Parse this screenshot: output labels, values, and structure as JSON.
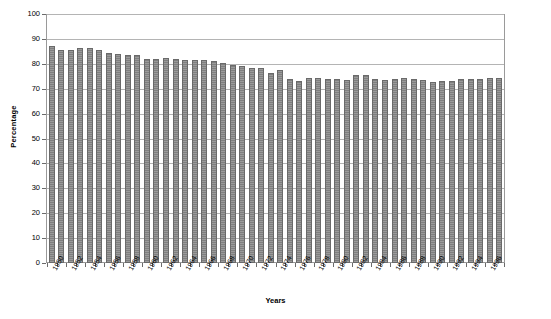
{
  "chart_data": {
    "type": "bar",
    "title": "",
    "xlabel": "Years",
    "ylabel": "Percentage",
    "ylim": [
      0,
      100
    ],
    "yticks": [
      0,
      10,
      20,
      30,
      40,
      50,
      60,
      70,
      80,
      90,
      100
    ],
    "grid": true,
    "legend": "none",
    "bar_color": "#7f7f7f",
    "categories": [
      "1950",
      "1951",
      "1952",
      "1953",
      "1954",
      "1955",
      "1956",
      "1957",
      "1958",
      "1959",
      "1960",
      "1961",
      "1962",
      "1963",
      "1964",
      "1965",
      "1966",
      "1967",
      "1968",
      "1969",
      "1970",
      "1971",
      "1972",
      "1973",
      "1974",
      "1975",
      "1976",
      "1977",
      "1978",
      "1979",
      "1980",
      "1981",
      "1982",
      "1983",
      "1984",
      "1985",
      "1986",
      "1987",
      "1988",
      "1989",
      "1990",
      "1991",
      "1992",
      "1993",
      "1994",
      "1995",
      "1996",
      "1997"
    ],
    "tick_labels": [
      "1950",
      "1952",
      "1954",
      "1956",
      "1958",
      "1960",
      "1962",
      "1964",
      "1966",
      "1968",
      "1970",
      "1972",
      "1974",
      "1976",
      "1978",
      "1980",
      "1982",
      "1984",
      "1986",
      "1988",
      "1990",
      "1992",
      "1994",
      "1996"
    ],
    "values": [
      87,
      85.5,
      85.5,
      86.5,
      86.5,
      85.5,
      84.5,
      84,
      83.5,
      83.5,
      82,
      82,
      82.5,
      82,
      81.5,
      81.5,
      81.5,
      81,
      80.5,
      79.5,
      79,
      78.5,
      78.5,
      76.5,
      77.5,
      74,
      73,
      74.5,
      74.5,
      74,
      74,
      73.5,
      75.5,
      75.5,
      74,
      73.5,
      74,
      74.5,
      74,
      73.5,
      72.5,
      73,
      73,
      74,
      74,
      74,
      74.5,
      74.5
    ]
  },
  "axis": {
    "x_title": "Years",
    "y_title": "Percentage"
  }
}
